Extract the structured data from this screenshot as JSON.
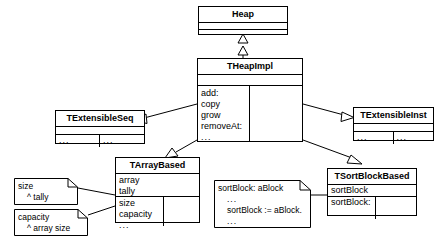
{
  "diagram": {
    "type": "uml-class-diagram",
    "ellipsis": "...",
    "classes": {
      "heap": {
        "name": "Heap",
        "attributes": [],
        "operations": []
      },
      "theapimpl": {
        "name": "THeapImpl",
        "attributes": [],
        "operations_left": [
          "add:",
          "copy",
          "grow",
          "removeAt:",
          "..."
        ],
        "operations_right": []
      },
      "textensibleseq": {
        "name": "TExtensibleSeq",
        "attributes": [],
        "operations_left": [
          "..."
        ],
        "operations_right": [
          "..."
        ]
      },
      "textensibleinst": {
        "name": "TExtensibleInst",
        "attributes": [],
        "operations_left": [
          "..."
        ],
        "operations_right": [
          "..."
        ]
      },
      "tarraybased": {
        "name": "TArrayBased",
        "attributes": [
          "array",
          "tally"
        ],
        "operations_left": [
          "size",
          "capacity",
          "..."
        ],
        "operations_right": []
      },
      "tsortblockbased": {
        "name": "TSortBlockBased",
        "attributes": [
          "sortBlock"
        ],
        "operations_left": [
          "sortBlock:",
          "..."
        ],
        "operations_right": []
      }
    },
    "notes": {
      "size_note": {
        "lines": [
          "size",
          "^ tally"
        ]
      },
      "capacity_note": {
        "lines": [
          "capacity",
          "^ array size"
        ]
      },
      "sortblock_note": {
        "lines": [
          "sortBlock: aBlock",
          "...",
          "sortBlock := aBlock.",
          "..."
        ]
      }
    },
    "relationships": [
      {
        "from": "THeapImpl",
        "to": "Heap",
        "kind": "realization-dashed-hollow-triangle"
      },
      {
        "from": "THeapImpl",
        "to": "TExtensibleSeq",
        "kind": "generalization-hollow-triangle"
      },
      {
        "from": "THeapImpl",
        "to": "TExtensibleInst",
        "kind": "generalization-hollow-triangle"
      },
      {
        "from": "THeapImpl",
        "to": "TArrayBased",
        "kind": "generalization-hollow-triangle"
      },
      {
        "from": "THeapImpl",
        "to": "TSortBlockBased",
        "kind": "generalization-hollow-triangle"
      }
    ]
  },
  "colors": {
    "stroke": "#000000",
    "fill": "#ffffff"
  }
}
